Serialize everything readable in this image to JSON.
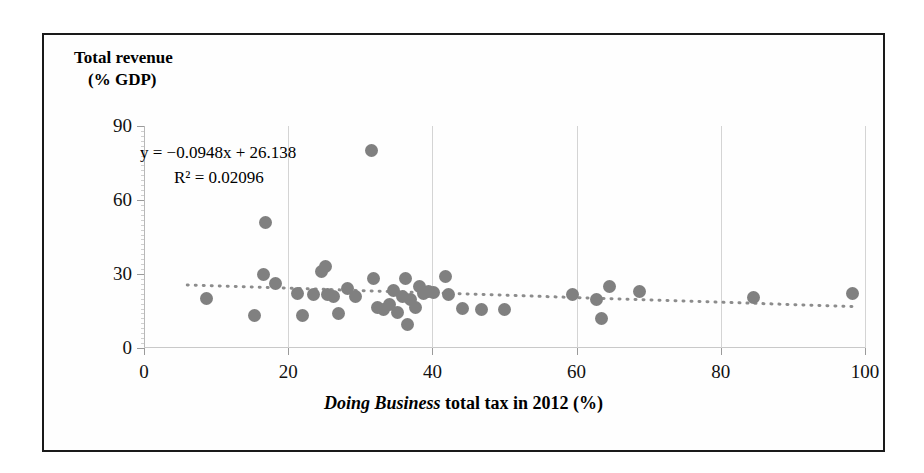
{
  "figure": {
    "y_axis_title_line1": "Total revenue",
    "y_axis_title_line2": "(% GDP)",
    "x_axis_title_italic": "Doing Business",
    "x_axis_title_rest": " total tax in 2012 (%)",
    "equation_text": "y = −0.0948x + 26.138",
    "r_squared_text": "R² = 0.02096",
    "marker_color": "#808080",
    "trendline_color": "#8c8c8c",
    "gridline_color": "#d4d4d4",
    "frame_color": "#1a1a1a"
  },
  "chart_data": {
    "type": "scatter",
    "title": "",
    "xlabel": "Doing Business total tax in 2012 (%)",
    "ylabel": "Total revenue (% GDP)",
    "xlim": [
      0,
      100
    ],
    "ylim": [
      0,
      90
    ],
    "xticks": [
      0,
      20,
      40,
      60,
      80,
      100
    ],
    "yticks": [
      0,
      30,
      60,
      90
    ],
    "grid": "vertical",
    "legend": "none",
    "annotations": [
      "y = −0.0948x + 26.138",
      "R² = 0.02096"
    ],
    "trendline": {
      "type": "linear-dotted",
      "slope": -0.0948,
      "intercept": 26.138,
      "r_squared": 0.02096,
      "x_start": 6,
      "x_end": 99
    },
    "points": [
      {
        "x": 8.7,
        "y": 20.0
      },
      {
        "x": 15.3,
        "y": 13.3
      },
      {
        "x": 16.6,
        "y": 30.0
      },
      {
        "x": 16.8,
        "y": 51.0
      },
      {
        "x": 18.3,
        "y": 26.0
      },
      {
        "x": 21.3,
        "y": 22.0
      },
      {
        "x": 22.0,
        "y": 13.0
      },
      {
        "x": 23.5,
        "y": 21.5
      },
      {
        "x": 24.6,
        "y": 31.0
      },
      {
        "x": 25.2,
        "y": 33.0
      },
      {
        "x": 25.4,
        "y": 21.5
      },
      {
        "x": 26.3,
        "y": 21.0
      },
      {
        "x": 27.0,
        "y": 14.0
      },
      {
        "x": 28.2,
        "y": 24.0
      },
      {
        "x": 29.4,
        "y": 21.0
      },
      {
        "x": 31.5,
        "y": 80.0
      },
      {
        "x": 31.8,
        "y": 28.0
      },
      {
        "x": 32.4,
        "y": 16.5
      },
      {
        "x": 33.2,
        "y": 15.5
      },
      {
        "x": 34.0,
        "y": 17.5
      },
      {
        "x": 34.6,
        "y": 23.5
      },
      {
        "x": 35.2,
        "y": 14.5
      },
      {
        "x": 35.8,
        "y": 21.0
      },
      {
        "x": 36.2,
        "y": 28.0
      },
      {
        "x": 36.5,
        "y": 9.5
      },
      {
        "x": 37.0,
        "y": 19.5
      },
      {
        "x": 37.6,
        "y": 16.5
      },
      {
        "x": 38.2,
        "y": 25.0
      },
      {
        "x": 38.8,
        "y": 22.0
      },
      {
        "x": 39.4,
        "y": 23.0
      },
      {
        "x": 40.2,
        "y": 22.5
      },
      {
        "x": 41.8,
        "y": 29.0
      },
      {
        "x": 42.3,
        "y": 21.5
      },
      {
        "x": 44.2,
        "y": 16.0
      },
      {
        "x": 46.8,
        "y": 15.5
      },
      {
        "x": 50.0,
        "y": 15.5
      },
      {
        "x": 59.5,
        "y": 21.5
      },
      {
        "x": 62.8,
        "y": 19.5
      },
      {
        "x": 63.5,
        "y": 12.0
      },
      {
        "x": 64.6,
        "y": 25.0
      },
      {
        "x": 68.7,
        "y": 23.0
      },
      {
        "x": 84.5,
        "y": 20.5
      },
      {
        "x": 98.3,
        "y": 22.0
      }
    ]
  }
}
